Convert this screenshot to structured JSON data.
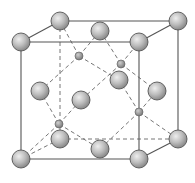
{
  "diagram": {
    "title": "",
    "type": "unit-cell-crystal-lattice",
    "colors": {
      "background": "#ffffff",
      "edge": "#555555",
      "atom_highlight": "#eeeeee",
      "atom_mid": "#bdbdbd",
      "atom_shadow": "#8a8a8a"
    },
    "cube": {
      "front": [
        [
          21,
          42
        ],
        [
          139,
          42
        ],
        [
          139,
          159
        ],
        [
          21,
          159
        ]
      ],
      "back": [
        [
          60,
          21
        ],
        [
          178,
          21
        ],
        [
          178,
          139
        ],
        [
          60,
          139
        ]
      ]
    },
    "large_atoms": [
      {
        "id": "corner-front-top-left",
        "x": 21,
        "y": 42
      },
      {
        "id": "corner-front-top-right",
        "x": 139,
        "y": 42
      },
      {
        "id": "corner-front-bottom-left",
        "x": 21,
        "y": 159
      },
      {
        "id": "corner-front-bottom-right",
        "x": 139,
        "y": 159
      },
      {
        "id": "corner-back-top-left",
        "x": 60,
        "y": 21
      },
      {
        "id": "corner-back-top-right",
        "x": 178,
        "y": 21
      },
      {
        "id": "corner-back-bottom-right",
        "x": 178,
        "y": 139
      },
      {
        "id": "corner-back-bottom-left",
        "x": 60,
        "y": 139
      },
      {
        "id": "face-top",
        "x": 100,
        "y": 31
      },
      {
        "id": "face-left",
        "x": 40,
        "y": 91
      },
      {
        "id": "face-right",
        "x": 157,
        "y": 91
      },
      {
        "id": "face-back",
        "x": 119,
        "y": 80
      },
      {
        "id": "face-front",
        "x": 81,
        "y": 100
      },
      {
        "id": "face-bottom",
        "x": 100,
        "y": 149
      }
    ],
    "small_atoms": [
      {
        "id": "tetra-1",
        "x": 79,
        "y": 56
      },
      {
        "id": "tetra-2",
        "x": 121,
        "y": 64
      },
      {
        "id": "tetra-3",
        "x": 59,
        "y": 124
      },
      {
        "id": "tetra-4",
        "x": 139,
        "y": 112
      }
    ],
    "bonds": [
      [
        79,
        56,
        60,
        21
      ],
      [
        79,
        56,
        100,
        31
      ],
      [
        79,
        56,
        40,
        91
      ],
      [
        79,
        56,
        119,
        80
      ],
      [
        121,
        64,
        100,
        31
      ],
      [
        121,
        64,
        139,
        42
      ],
      [
        121,
        64,
        157,
        91
      ],
      [
        121,
        64,
        81,
        100
      ],
      [
        59,
        124,
        40,
        91
      ],
      [
        59,
        124,
        81,
        100
      ],
      [
        59,
        124,
        100,
        149
      ],
      [
        59,
        124,
        21,
        159
      ],
      [
        139,
        112,
        119,
        80
      ],
      [
        139,
        112,
        157,
        91
      ],
      [
        139,
        112,
        178,
        139
      ],
      [
        139,
        112,
        100,
        149
      ]
    ],
    "large_radius": 9,
    "small_radius": 4
  }
}
